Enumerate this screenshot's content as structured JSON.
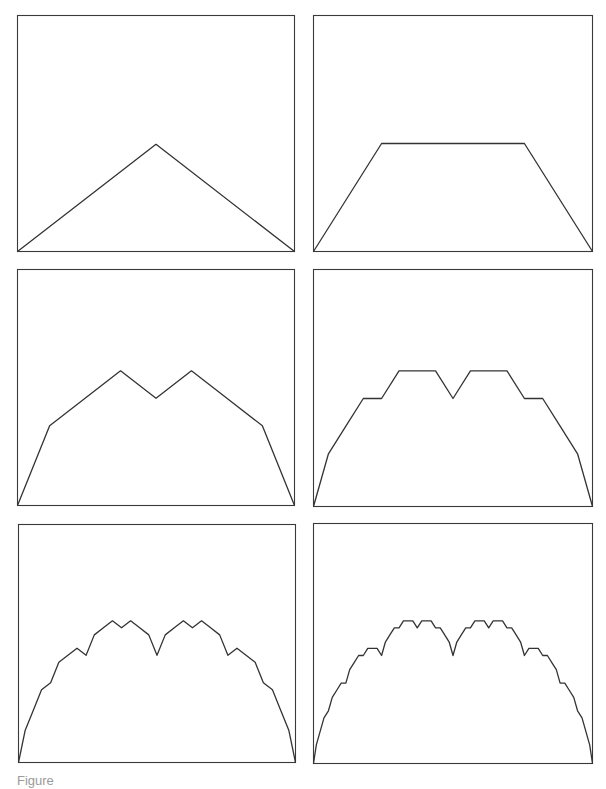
{
  "figure": {
    "line_color": "#333333",
    "frame_color": "#3a3a3a",
    "background": "#ffffff",
    "generator": {
      "type": "levy-c-curve",
      "turn_angle_deg": 8.8,
      "vertical_exaggeration": 5.0,
      "bump_side": "up"
    },
    "panels": [
      {
        "id": "panel-1",
        "order": 1,
        "segments": 2,
        "box": {
          "x": 17,
          "y": 15,
          "w": 277,
          "h": 236
        }
      },
      {
        "id": "panel-2",
        "order": 2,
        "segments": 4,
        "box": {
          "x": 313,
          "y": 15,
          "w": 279,
          "h": 236
        }
      },
      {
        "id": "panel-3",
        "order": 3,
        "segments": 8,
        "box": {
          "x": 17,
          "y": 269,
          "w": 277,
          "h": 236
        }
      },
      {
        "id": "panel-4",
        "order": 4,
        "segments": 16,
        "box": {
          "x": 313,
          "y": 269,
          "w": 279,
          "h": 237
        }
      },
      {
        "id": "panel-5",
        "order": 5,
        "segments": 32,
        "box": {
          "x": 18,
          "y": 524,
          "w": 277,
          "h": 238
        }
      },
      {
        "id": "panel-6",
        "order": 6,
        "segments": 64,
        "box": {
          "x": 313,
          "y": 523,
          "w": 279,
          "h": 240
        }
      }
    ]
  },
  "caption": {
    "text": "Figure"
  }
}
